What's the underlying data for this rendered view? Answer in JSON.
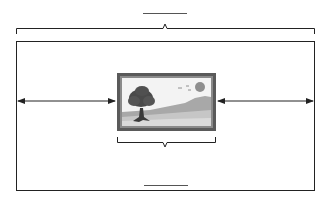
{
  "diagram": {
    "type": "picture-placement-measurement",
    "labels": {
      "top_blank": "",
      "bottom_blank": ""
    },
    "elements": {
      "wall": "outer-rectangle",
      "picture": "framed landscape picture with tree, sun, birds and hills",
      "top_bracket": "wall width",
      "bottom_bracket": "picture width",
      "left_arrow": "left spacing",
      "right_arrow": "right spacing"
    },
    "colors": {
      "line": "#222222",
      "frame_outer": "#555555",
      "frame_inner": "#8a8a8a",
      "sky": "#f2f2f2",
      "sun": "#8e8e8e",
      "hill_dark": "#a9a9a9",
      "hill_light": "#c8c8c8",
      "ground": "#d9d9d9",
      "tree": "#4a4a4a"
    }
  }
}
